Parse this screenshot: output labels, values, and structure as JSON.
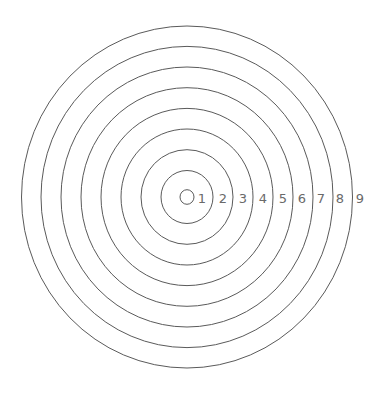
{
  "diagram": {
    "type": "concentric-rings",
    "center": {
      "x": 187,
      "y": 197
    },
    "center_circle": {
      "rx": 7,
      "ry": 7.3
    },
    "rings": [
      {
        "index": 1,
        "rx": 26,
        "ry": 26.5
      },
      {
        "index": 2,
        "rx": 46,
        "ry": 47.3
      },
      {
        "index": 3,
        "rx": 66,
        "ry": 68
      },
      {
        "index": 4,
        "rx": 86,
        "ry": 88.6
      },
      {
        "index": 5,
        "rx": 106,
        "ry": 109.3
      },
      {
        "index": 6,
        "rx": 126,
        "ry": 130
      },
      {
        "index": 7,
        "rx": 146,
        "ry": 150.6
      },
      {
        "index": 8,
        "rx": 165.5,
        "ry": 171
      }
    ],
    "labels": [
      {
        "text": "1",
        "x": 202
      },
      {
        "text": "2",
        "x": 223
      },
      {
        "text": "3",
        "x": 243
      },
      {
        "text": "4",
        "x": 263
      },
      {
        "text": "5",
        "x": 283
      },
      {
        "text": "6",
        "x": 302
      },
      {
        "text": "7",
        "x": 321
      },
      {
        "text": "8",
        "x": 340
      },
      {
        "text": "9",
        "x": 360
      }
    ],
    "colors": {
      "ring_stroke": "#5a5a5a",
      "label_text": "#6a6a6a",
      "background": "#ffffff"
    }
  }
}
